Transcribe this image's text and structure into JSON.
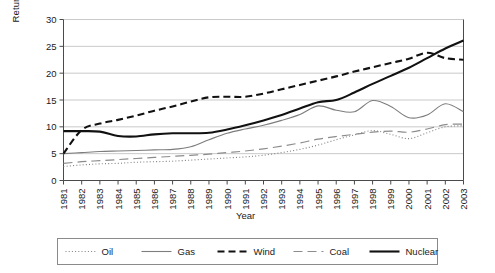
{
  "chart_data": {
    "type": "line",
    "title": "",
    "xlabel": "Year",
    "ylabel": "Returns (kWh/US $)",
    "xlim": [
      1981,
      2003
    ],
    "ylim": [
      0,
      30
    ],
    "yticks": [
      0,
      5,
      10,
      15,
      20,
      25,
      30
    ],
    "grid": true,
    "legend_position": "bottom",
    "categories": [
      "1981",
      "1982",
      "1983",
      "1984",
      "1985",
      "1986",
      "1987",
      "1988",
      "1989",
      "1990",
      "1991",
      "1992",
      "1993",
      "1994",
      "1995",
      "1996",
      "1997",
      "1998",
      "1999",
      "2000",
      "2001",
      "2002",
      "2003"
    ],
    "x": [
      1981,
      1982,
      1983,
      1984,
      1985,
      1986,
      1987,
      1988,
      1989,
      1990,
      1991,
      1992,
      1993,
      1994,
      1995,
      1996,
      1997,
      1998,
      1999,
      2000,
      2001,
      2002,
      2003
    ],
    "series": [
      {
        "name": "Oil",
        "style": "dotted",
        "color": "#808080",
        "width": 1.1,
        "values": [
          2.6,
          2.9,
          3.1,
          3.2,
          3.4,
          3.5,
          3.6,
          3.8,
          4.0,
          4.2,
          4.4,
          4.7,
          5.2,
          5.8,
          6.6,
          7.6,
          8.5,
          9.3,
          8.6,
          7.8,
          8.9,
          10.0,
          10.2
        ]
      },
      {
        "name": "Gas",
        "style": "solid",
        "color": "#7d7d7d",
        "width": 1.1,
        "values": [
          5.0,
          5.2,
          5.4,
          5.5,
          5.6,
          5.7,
          5.8,
          6.3,
          7.6,
          8.8,
          9.6,
          10.3,
          11.2,
          12.3,
          13.9,
          13.1,
          12.8,
          14.9,
          13.8,
          11.7,
          12.2,
          14.3,
          12.8
        ]
      },
      {
        "name": "Wind",
        "style": "dashed",
        "color": "#111111",
        "width": 2.1,
        "values": [
          5.0,
          9.4,
          10.6,
          11.3,
          12.1,
          13.0,
          13.8,
          14.7,
          15.5,
          15.6,
          15.6,
          16.2,
          17.0,
          17.8,
          18.6,
          19.4,
          20.3,
          21.1,
          21.9,
          22.7,
          23.8,
          22.8,
          22.5
        ]
      },
      {
        "name": "Coal",
        "style": "longdash",
        "color": "#8c8c8c",
        "width": 1.2,
        "values": [
          3.2,
          3.5,
          3.7,
          3.9,
          4.1,
          4.3,
          4.5,
          4.7,
          4.9,
          5.2,
          5.5,
          5.9,
          6.4,
          7.0,
          7.7,
          8.2,
          8.6,
          9.0,
          9.2,
          9.0,
          9.6,
          10.4,
          10.5
        ]
      },
      {
        "name": "Nuclear",
        "style": "solid",
        "color": "#111111",
        "width": 2.1,
        "values": [
          9.2,
          9.2,
          9.1,
          8.3,
          8.2,
          8.6,
          8.8,
          8.8,
          8.9,
          9.5,
          10.3,
          11.2,
          12.2,
          13.4,
          14.6,
          15.0,
          16.4,
          18.0,
          19.5,
          21.0,
          22.8,
          24.6,
          26.1
        ]
      }
    ]
  },
  "legend": {
    "items": [
      {
        "label": "Oil"
      },
      {
        "label": "Gas"
      },
      {
        "label": "Wind"
      },
      {
        "label": "Coal"
      },
      {
        "label": "Nuclear"
      }
    ]
  },
  "axes": {
    "y_title": "Returns (kWh/US $)",
    "x_title": "Year"
  }
}
